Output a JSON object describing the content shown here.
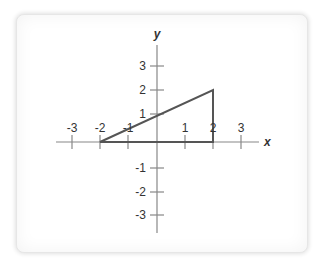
{
  "diagram": {
    "type": "coordinate-plane",
    "axes": {
      "x_label": "x",
      "y_label": "y",
      "x_ticks": [
        "-3",
        "-2",
        "-1",
        "1",
        "2",
        "3"
      ],
      "y_ticks": [
        "3",
        "2",
        "1",
        "-1",
        "-2",
        "-3"
      ],
      "range": [
        -3,
        3
      ]
    },
    "shape": {
      "type": "triangle",
      "vertices": [
        [
          -2,
          0
        ],
        [
          2,
          0
        ],
        [
          2,
          2
        ]
      ]
    },
    "colors": {
      "axis": "#888888",
      "shape": "#555555",
      "text": "#333333"
    }
  }
}
